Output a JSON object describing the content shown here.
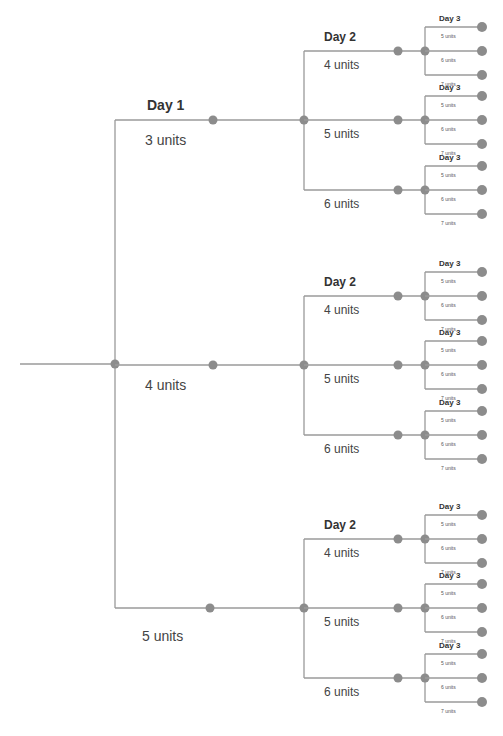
{
  "diagram": {
    "type": "decision-tree",
    "colors": {
      "line": "#9a9a9a",
      "node": "#8c8c8c",
      "text": "#444444"
    },
    "day1_label": "Day 1",
    "day2_label": "Day 2",
    "day3_label": "Day 3",
    "day1_branches": [
      {
        "label": "3 units",
        "day2_branches": [
          {
            "label": "4 units",
            "day3_branches": [
              "5 units",
              "6 units",
              "7 units"
            ]
          },
          {
            "label": "5 units",
            "day3_branches": [
              "5 units",
              "6 units",
              "7 units"
            ]
          },
          {
            "label": "6 units",
            "day3_branches": [
              "5 units",
              "6 units",
              "7 units"
            ]
          }
        ]
      },
      {
        "label": "4 units",
        "day2_branches": [
          {
            "label": "4 units",
            "day3_branches": [
              "5 units",
              "6 units",
              "7 units"
            ]
          },
          {
            "label": "5 units",
            "day3_branches": [
              "5 units",
              "6 units",
              "7 units"
            ]
          },
          {
            "label": "6 units",
            "day3_branches": [
              "5 units",
              "6 units",
              "7 units"
            ]
          }
        ]
      },
      {
        "label": "5 units",
        "day2_branches": [
          {
            "label": "4 units",
            "day3_branches": [
              "5 units",
              "6 units",
              "7 units"
            ]
          },
          {
            "label": "5 units",
            "day3_branches": [
              "5 units",
              "6 units",
              "7 units"
            ]
          },
          {
            "label": "6 units",
            "day3_branches": [
              "5 units",
              "6 units",
              "7 units"
            ]
          }
        ]
      }
    ]
  }
}
